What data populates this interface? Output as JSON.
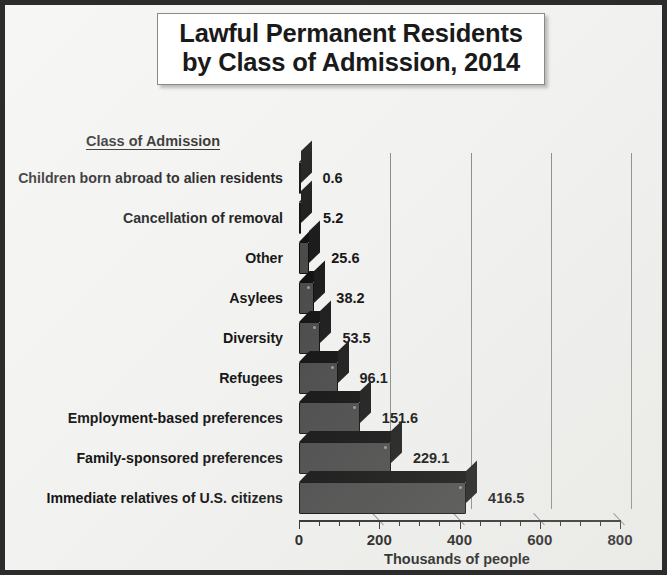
{
  "title": {
    "line1": "Lawful Permanent Residents",
    "line2": "by Class of Admission, 2014"
  },
  "category_header": "Class of Admission",
  "axis": {
    "title": "Thousands of people",
    "ticks": [
      "0",
      "200",
      "400",
      "600",
      "800"
    ]
  },
  "colors": {
    "bar_fill": "#4b4b4b",
    "bar_shadow": "#121212",
    "frame": "#2c2c2c",
    "background": "#f2f2f0",
    "gridline": "#8d8d8d",
    "text": "#141414"
  },
  "chart_data": {
    "type": "bar",
    "orientation": "horizontal",
    "title": "Lawful Permanent Residents by Class of Admission, 2014",
    "xlabel": "Thousands of people",
    "ylabel": "Class of Admission",
    "xlim": [
      0,
      800
    ],
    "xticks": [
      0,
      200,
      400,
      600,
      800
    ],
    "minor_tick_interval": 50,
    "grid": "vertical-major-only",
    "legend": "none",
    "categories": [
      "Children born abroad to alien residents",
      "Cancellation of removal",
      "Other",
      "Asylees",
      "Diversity",
      "Refugees",
      "Employment-based preferences",
      "Family-sponsored preferences",
      "Immediate relatives of U.S. citizens"
    ],
    "values": [
      0.6,
      5.2,
      25.6,
      38.2,
      53.5,
      96.1,
      151.6,
      229.1,
      416.5
    ],
    "value_labels": [
      "0.6",
      "5.2",
      "25.6",
      "38.2",
      "53.5",
      "96.1",
      "151.6",
      "229.1",
      "416.5"
    ]
  }
}
